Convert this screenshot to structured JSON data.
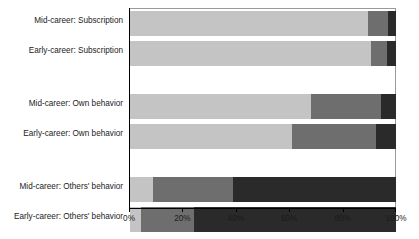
{
  "chart_data": {
    "type": "bar",
    "orientation": "horizontal",
    "stacked": true,
    "normalized_percent": true,
    "title": "",
    "subtitle": "",
    "xlabel": "",
    "ylabel": "",
    "xlim": [
      0,
      100
    ],
    "grid": false,
    "legend": "none",
    "xticks": [
      0,
      20,
      40,
      60,
      80,
      100
    ],
    "xtick_labels": [
      "0%",
      "20%",
      "40%",
      "60%",
      "80%",
      "100%"
    ],
    "categories": [
      "Mid-career: Subscription",
      "Early-career: Subscription",
      "Mid-career: Own behavior",
      "Early-career: Own behavior",
      "Mid-career: Others' behavior",
      "Early-career: Others' behavior"
    ],
    "group_breaks_after": [
      1,
      3
    ],
    "series": [
      {
        "name": "segment-1-light",
        "color": "#c4c4c4",
        "values": [
          89.5,
          90.5,
          68.0,
          61.0,
          8.8,
          4.0
        ]
      },
      {
        "name": "segment-2-medium",
        "color": "#6e6e6e",
        "values": [
          7.5,
          6.0,
          26.5,
          31.5,
          30.0,
          20.0
        ]
      },
      {
        "name": "segment-3-dark",
        "color": "#2a2a2a",
        "values": [
          3.0,
          3.5,
          5.5,
          7.5,
          61.2,
          76.0
        ]
      }
    ],
    "rows": [
      {
        "label": "Mid-career: Subscription",
        "values": [
          89.5,
          7.5,
          3.0
        ]
      },
      {
        "label": "Early-career: Subscription",
        "values": [
          90.5,
          6.0,
          3.5
        ]
      },
      {
        "label": "Mid-career: Own behavior",
        "values": [
          68.0,
          26.5,
          5.5
        ]
      },
      {
        "label": "Early-career: Own behavior",
        "values": [
          61.0,
          31.5,
          7.5
        ]
      },
      {
        "label": "Mid-career: Others' behavior",
        "values": [
          8.8,
          30.0,
          61.2
        ]
      },
      {
        "label": "Early-career: Others' behavior",
        "values": [
          4.0,
          20.0,
          76.0
        ]
      }
    ]
  },
  "colors": {
    "light": "#c4c4c4",
    "medium": "#6e6e6e",
    "dark": "#2a2a2a",
    "axis": "#000000",
    "frame": "#9a9a9a",
    "text": "#1b1b1b",
    "background": "#ffffff"
  }
}
